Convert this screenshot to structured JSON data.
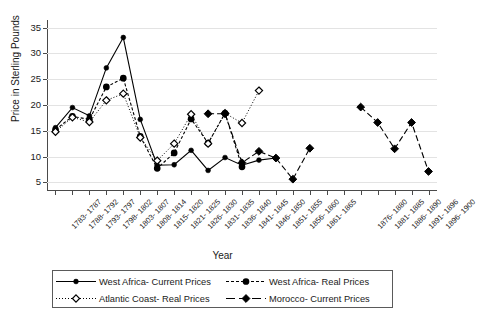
{
  "chart_data": {
    "type": "line",
    "title": "",
    "xlabel": "Year",
    "ylabel": "Price in Sterling Pounds",
    "ylim": [
      3.5,
      36.5
    ],
    "yticks": [
      5,
      10,
      15,
      20,
      25,
      30,
      35
    ],
    "grid": true,
    "legend_position": "bottom",
    "categories": [
      "1783- 1787",
      "1788- 1792",
      "1793- 1797",
      "1798- 1802",
      "1803- 1807",
      "1808- 1814",
      "1815- 1820",
      "1821- 1825",
      "1826- 1830",
      "1831- 1835",
      "1836- 1840",
      "1841- 1845",
      "1846- 1850",
      "1851- 1855",
      "1856- 1860",
      "1861- 1865",
      "",
      "",
      "1876- 1880",
      "1881- 1885",
      "1886- 1890",
      "1891- 1896",
      "1896- 1900"
    ],
    "series": [
      {
        "name": "West Africa- Current Prices",
        "line_style": "solid",
        "marker": "filled-circle",
        "color": "#000000",
        "values": [
          15.6,
          19.5,
          17.9,
          27.2,
          33.1,
          17.2,
          8.3,
          8.4,
          11.2,
          7.3,
          9.8,
          8.3,
          9.3,
          9.7,
          null,
          null,
          null,
          null,
          null,
          null,
          null,
          null,
          null
        ]
      },
      {
        "name": "West Africa- Real Prices",
        "line_style": "dashed",
        "marker": "small-filled-circle",
        "color": "#000000",
        "values": [
          15.2,
          17.8,
          17.2,
          23.5,
          25.2,
          13.9,
          7.7,
          10.7,
          17.3,
          12.6,
          18.4,
          8.0,
          null,
          null,
          null,
          null,
          null,
          null,
          null,
          null,
          null,
          null,
          null
        ]
      },
      {
        "name": "Atlantic Coast- Real Prices",
        "line_style": "dotted",
        "marker": "open-diamond",
        "color": "#000000",
        "values": [
          14.8,
          17.6,
          16.7,
          20.9,
          22.2,
          13.7,
          9.2,
          12.5,
          18.2,
          12.5,
          18.4,
          16.5,
          22.8,
          null,
          null,
          null,
          null,
          null,
          null,
          null,
          null,
          null,
          null
        ]
      },
      {
        "name": "Morocco- Current Prices",
        "line_style": "dash-dash",
        "marker": "filled-diamond",
        "color": "#000000",
        "values": [
          null,
          null,
          null,
          null,
          null,
          null,
          null,
          null,
          null,
          18.3,
          18.3,
          8.8,
          11.0,
          9.7,
          5.6,
          11.6,
          null,
          null,
          19.6,
          16.6,
          11.5,
          16.6,
          7.1
        ]
      }
    ]
  },
  "legend": {
    "items": [
      {
        "label": "West Africa- Current Prices",
        "style": "solid-circle"
      },
      {
        "label": "West Africa- Real Prices",
        "style": "dashed-smallcircle"
      },
      {
        "label": "Atlantic Coast- Real Prices",
        "style": "dotted-diamond"
      },
      {
        "label": "Morocco- Current Prices",
        "style": "dashdash-filleddiamond"
      }
    ]
  }
}
